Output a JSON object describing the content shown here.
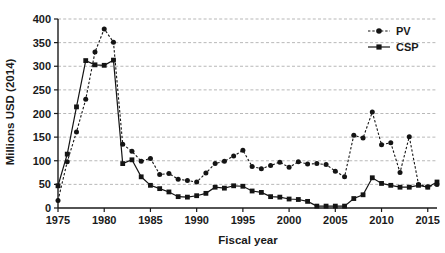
{
  "chart_data": {
    "type": "line",
    "title": "",
    "xlabel": "Fiscal year",
    "ylabel": "Millions USD (2014)",
    "xlim": [
      1975,
      2016
    ],
    "ylim": [
      0,
      400
    ],
    "grid": true,
    "legend_position": "top-right",
    "xticks": [
      "1975",
      "1980",
      "1985",
      "1990",
      "1995",
      "2000",
      "2005",
      "2010",
      "2015"
    ],
    "xtick_values": [
      1975,
      1980,
      1985,
      1990,
      1995,
      2000,
      2005,
      2010,
      2015
    ],
    "yticks": [
      "0",
      "50",
      "100",
      "150",
      "200",
      "250",
      "300",
      "350",
      "400"
    ],
    "ytick_values": [
      0,
      50,
      100,
      150,
      200,
      250,
      300,
      350,
      400
    ],
    "x": [
      1975,
      1976,
      1977,
      1978,
      1979,
      1980,
      1981,
      1982,
      1983,
      1984,
      1985,
      1986,
      1987,
      1988,
      1989,
      1990,
      1991,
      1992,
      1993,
      1994,
      1995,
      1996,
      1997,
      1998,
      1999,
      2000,
      2001,
      2002,
      2003,
      2004,
      2005,
      2006,
      2007,
      2008,
      2009,
      2010,
      2011,
      2012,
      2013,
      2014,
      2015,
      2016
    ],
    "series": [
      {
        "name": "PV",
        "marker": "circle",
        "linestyle": "dotted",
        "color": "#141414",
        "values": [
          16,
          98,
          161,
          230,
          330,
          379,
          351,
          135,
          120,
          99,
          105,
          71,
          73,
          61,
          58,
          55,
          74,
          94,
          99,
          110,
          122,
          88,
          83,
          90,
          97,
          86,
          98,
          93,
          94,
          92,
          78,
          66,
          154,
          148,
          203,
          134,
          138,
          75,
          151,
          50,
          45,
          50
        ]
      },
      {
        "name": "CSP",
        "marker": "square",
        "linestyle": "solid",
        "color": "#141414",
        "values": [
          47,
          114,
          214,
          312,
          303,
          302,
          313,
          94,
          102,
          66,
          48,
          41,
          34,
          24,
          23,
          26,
          31,
          44,
          42,
          47,
          46,
          36,
          33,
          24,
          23,
          19,
          18,
          14,
          4,
          4,
          4,
          4,
          20,
          28,
          64,
          52,
          48,
          44,
          44,
          48,
          44,
          55
        ]
      }
    ]
  },
  "legend": {
    "items": [
      {
        "label": "PV",
        "marker": "circle",
        "linestyle": "dotted"
      },
      {
        "label": "CSP",
        "marker": "square",
        "linestyle": "solid"
      }
    ]
  }
}
